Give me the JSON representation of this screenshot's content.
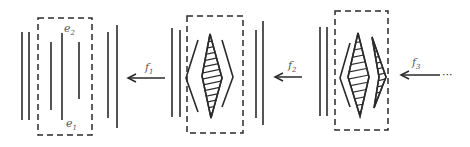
{
  "diagram": {
    "colors": {
      "ink": "#2a2a2a",
      "label": "#555555",
      "background": "#ffffff"
    },
    "panels": [
      {
        "id": "panel-1",
        "labels": {
          "top": "e",
          "top_sub": "2",
          "bottom": "e",
          "bottom_sub": "1"
        },
        "content": "parallel vertical lines"
      },
      {
        "id": "panel-2",
        "content": "hatched diamond between two chevrons"
      },
      {
        "id": "panel-3",
        "content": "hatched diamond and smaller hatched half-diamond with chevron"
      }
    ],
    "arrows": [
      {
        "id": "f1",
        "label": "f",
        "sub": "1",
        "direction": "left"
      },
      {
        "id": "f2",
        "label": "f",
        "sub": "2",
        "direction": "left"
      },
      {
        "id": "f3",
        "label": "f",
        "sub": "3",
        "direction": "left",
        "trailing": "···"
      }
    ]
  }
}
